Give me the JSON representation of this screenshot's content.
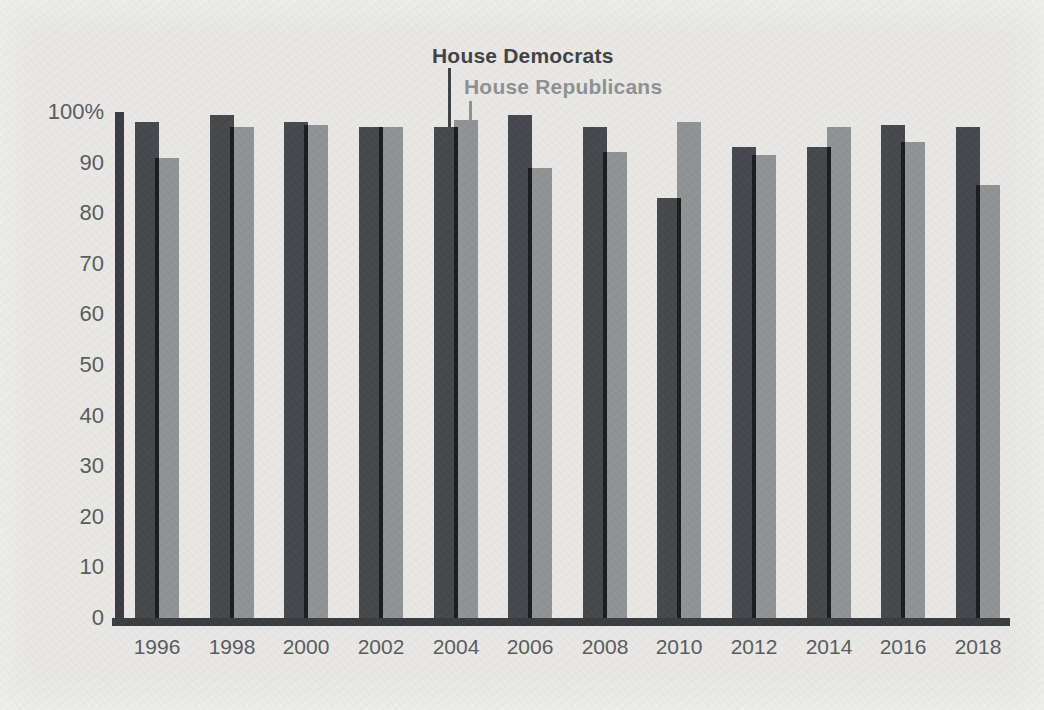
{
  "page": {
    "background": "#e9e8e4"
  },
  "legend": {
    "democrats": "House Democrats",
    "republicans": "House Republicans"
  },
  "colors": {
    "democrat_bar": "#41454a",
    "republican_bar": "#8e9194",
    "bar_overlap": "#17181a",
    "axis": "#35393d",
    "tick_label": "#55585c",
    "year_label": "#55585c",
    "democrat_legend_text": "#3b3f43",
    "republican_legend_text": "#8b8f92"
  },
  "chart_data": {
    "type": "bar",
    "title": "",
    "xlabel": "",
    "ylabel": "",
    "categories": [
      "1996",
      "1998",
      "2000",
      "2002",
      "2004",
      "2006",
      "2008",
      "2010",
      "2012",
      "2014",
      "2016",
      "2018"
    ],
    "series": [
      {
        "name": "House Democrats",
        "values": [
          98,
          99.5,
          98,
          97,
          97,
          99.5,
          97,
          83,
          93,
          93,
          97.5,
          97
        ]
      },
      {
        "name": "House Republicans",
        "values": [
          91,
          97,
          97.5,
          97,
          98.5,
          89,
          92,
          98,
          91.5,
          97,
          94,
          85.5
        ]
      }
    ],
    "ylim": [
      0,
      100
    ],
    "yticks": [
      0,
      10,
      20,
      30,
      40,
      50,
      60,
      70,
      80,
      90,
      100
    ],
    "ytick_labels": [
      "0",
      "10",
      "20",
      "30",
      "40",
      "50",
      "60",
      "70",
      "80",
      "90",
      "100%"
    ],
    "grid": false,
    "legend_position": "top-center, stacked labels with leader lines pointing to the 2004 bars"
  }
}
